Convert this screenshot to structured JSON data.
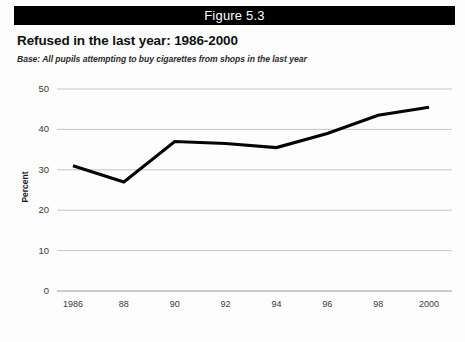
{
  "header": {
    "figure_label": "Figure 5.3",
    "bar_color": "#000000",
    "text_color": "#ffffff"
  },
  "title": "Refused in the last year: 1986-2000",
  "subtitle": "Base: All pupils attempting to buy cigarettes from shops in the last year",
  "chart_data": {
    "type": "line",
    "title": "Refused in the last year: 1986-2000",
    "subtitle": "Base: All pupils attempting to buy cigarettes from shops in the last year",
    "xlabel": "",
    "ylabel": "Percent",
    "categories": [
      "1986",
      "88",
      "90",
      "92",
      "94",
      "96",
      "98",
      "2000"
    ],
    "x_values": [
      1986,
      1988,
      1990,
      1992,
      1994,
      1996,
      1998,
      2000
    ],
    "values": [
      31,
      27,
      37,
      36.5,
      35.5,
      39,
      43.5,
      45.5
    ],
    "series": [
      {
        "name": "Refused in the last year",
        "color": "#050505",
        "values": [
          31,
          27,
          37,
          36.5,
          35.5,
          39,
          43.5,
          45.5
        ]
      }
    ],
    "ylim": [
      0,
      50
    ],
    "yticks": [
      0,
      10,
      20,
      30,
      40,
      50
    ],
    "ytick_labels": [
      "0",
      "10",
      "20",
      "30",
      "40",
      "50"
    ],
    "grid": true,
    "grid_axis": "y",
    "legend": false,
    "markers": false
  },
  "axis": {
    "y_title": "Percent"
  }
}
